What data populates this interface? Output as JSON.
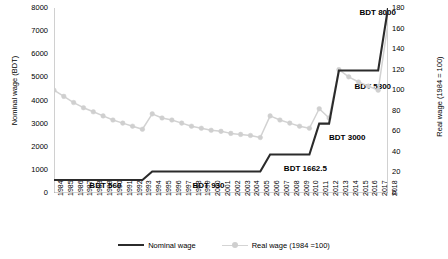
{
  "chart_data": {
    "type": "line",
    "title": "",
    "xlabel": "",
    "ylabel_left": "Nominal wage (BDT)",
    "ylabel_right": "Real wage (1984 = 100)",
    "ylim_left": [
      0,
      8000
    ],
    "ylim_right": [
      0,
      180
    ],
    "ytick_step_left": 1000,
    "ytick_step_right": 20,
    "grid": false,
    "legend_position": "bottom",
    "x": [
      1984,
      1985,
      1986,
      1987,
      1988,
      1989,
      1990,
      1991,
      1992,
      1993,
      1994,
      1995,
      1996,
      1997,
      1998,
      1999,
      2000,
      2001,
      2002,
      2003,
      2004,
      2005,
      2006,
      2007,
      2008,
      2009,
      2010,
      2011,
      2012,
      2013,
      2014,
      2015,
      2016,
      2017,
      2018
    ],
    "yticks_left": [
      "0",
      "1000",
      "2000",
      "3000",
      "4000",
      "5000",
      "6000",
      "7000",
      "8000"
    ],
    "yticks_right": [
      "0",
      "20",
      "40",
      "60",
      "80",
      "100",
      "120",
      "140",
      "160",
      "180"
    ],
    "xticks": [
      "1984",
      "1985",
      "1986",
      "1987",
      "1988",
      "1989",
      "1990",
      "1991",
      "1992",
      "1993",
      "1994",
      "1995",
      "1996",
      "1997",
      "1998",
      "1999",
      "2000",
      "2001",
      "2002",
      "2003",
      "2004",
      "2005",
      "2006",
      "2007",
      "2008",
      "2009",
      "2010",
      "2011",
      "2012",
      "2013",
      "2014",
      "2015",
      "2016",
      "2017",
      "2018"
    ],
    "series": [
      {
        "name": "Nominal wage",
        "axis": "left",
        "color": "#2b2b2b",
        "style": "step",
        "markers": false,
        "values": [
          560,
          560,
          560,
          560,
          560,
          560,
          560,
          560,
          560,
          560,
          930,
          930,
          930,
          930,
          930,
          930,
          930,
          930,
          930,
          930,
          930,
          930,
          1662.5,
          1662.5,
          1662.5,
          1662.5,
          1662.5,
          3000,
          3000,
          5300,
          5300,
          5300,
          5300,
          5300,
          8000
        ]
      },
      {
        "name": "Real wage (1984 =100)",
        "axis": "right",
        "color": "#d2d2d2",
        "style": "line",
        "markers": true,
        "values": [
          100,
          94,
          88,
          83,
          79,
          75,
          71,
          68,
          65,
          62,
          77,
          73,
          71,
          68,
          65,
          63,
          61,
          60,
          58,
          57,
          56,
          54,
          75,
          71,
          68,
          65,
          63,
          82,
          73,
          120,
          113,
          108,
          104,
          100,
          165
        ]
      }
    ],
    "annotations": [
      {
        "text": "BDT 560",
        "x": 1987.6,
        "value_left": 300
      },
      {
        "text": "BDT 930",
        "x": 1998.1,
        "value_left": 300
      },
      {
        "text": "BDT 1662.5",
        "x": 2007.4,
        "value_left": 1050
      },
      {
        "text": "BDT 3000",
        "x": 2012.0,
        "value_left": 2400
      },
      {
        "text": "BDT 5300",
        "x": 2014.6,
        "value_left": 4600
      },
      {
        "text": "BDT 8000",
        "x": 2015.1,
        "value_left": 7780
      }
    ]
  },
  "legend": {
    "items": [
      {
        "label": "Nominal wage"
      },
      {
        "label": "Real wage (1984 =100)"
      }
    ]
  }
}
